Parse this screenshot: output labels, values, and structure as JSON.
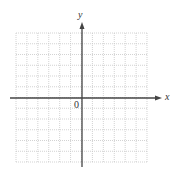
{
  "figure": {
    "type": "coordinate-grid",
    "grid": {
      "columns": 12,
      "rows": 12,
      "left": 16,
      "top": 33,
      "right": 147,
      "bottom": 162,
      "line_color": "#c8c8c8",
      "line_style": "dotted"
    },
    "axes": {
      "color": "#444444",
      "x_axis": {
        "label": "x",
        "y_position": 98,
        "from": 10,
        "to": 162
      },
      "y_axis": {
        "label": "y",
        "x_position": 82,
        "from": 167,
        "to": 22
      },
      "origin_label": "0"
    }
  }
}
